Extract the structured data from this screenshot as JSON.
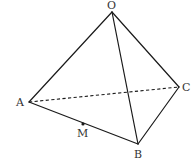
{
  "diagram": {
    "type": "tetrahedron",
    "vertices": {
      "O": {
        "label": "O",
        "x": 112,
        "y": 12,
        "label_x": 107,
        "label_y": 9
      },
      "A": {
        "label": "A",
        "x": 29,
        "y": 102,
        "label_x": 16,
        "label_y": 106
      },
      "B": {
        "label": "B",
        "x": 138,
        "y": 144,
        "label_x": 134,
        "label_y": 158
      },
      "C": {
        "label": "C",
        "x": 179,
        "y": 87,
        "label_x": 182,
        "label_y": 91
      }
    },
    "points": {
      "M": {
        "label": "M",
        "x": 83,
        "y": 124,
        "label_x": 77,
        "label_y": 137,
        "on_edge": "AB"
      }
    },
    "edges": [
      {
        "from": "O",
        "to": "A",
        "style": "solid"
      },
      {
        "from": "O",
        "to": "B",
        "style": "solid"
      },
      {
        "from": "O",
        "to": "C",
        "style": "solid"
      },
      {
        "from": "A",
        "to": "B",
        "style": "solid"
      },
      {
        "from": "B",
        "to": "C",
        "style": "solid"
      },
      {
        "from": "A",
        "to": "C",
        "style": "dashed"
      }
    ],
    "colors": {
      "line": "#1a1a1a",
      "label": "#333333",
      "background": "#ffffff"
    }
  }
}
